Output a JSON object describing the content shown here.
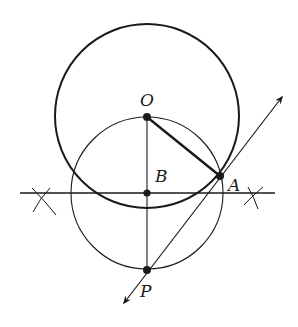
{
  "diagram": {
    "labels": {
      "O": "O",
      "B": "B",
      "A": "A",
      "P": "P"
    },
    "colors": {
      "stroke": "#1a1a1a",
      "background": "#ffffff"
    },
    "points": {
      "O": [
        147,
        117
      ],
      "B": [
        147,
        193
      ],
      "A": [
        220,
        176
      ],
      "P": [
        147,
        270
      ]
    },
    "circles": [
      {
        "name": "circle-O",
        "center": "O",
        "radius": 92
      },
      {
        "name": "circle-B",
        "center": "B",
        "radius": 76
      }
    ]
  }
}
